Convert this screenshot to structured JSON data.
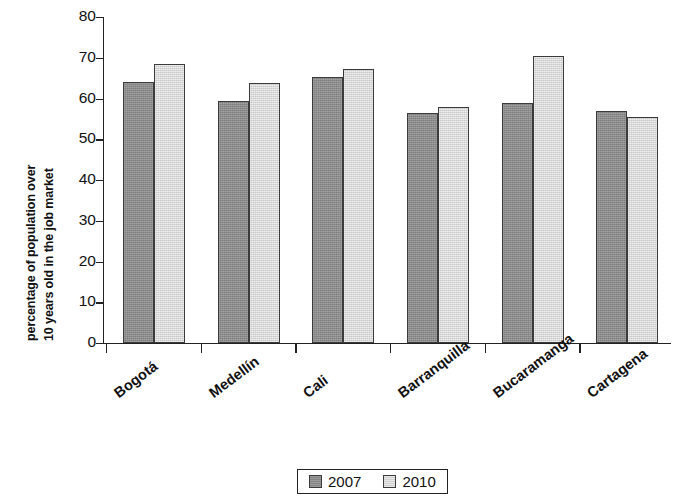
{
  "chart_data": {
    "type": "bar",
    "title": "",
    "xlabel": "",
    "ylabel": "percentage of population over 10 years old in the job market",
    "ylabel_lines": [
      "percentage of population over",
      "10 years old in the job market"
    ],
    "categories": [
      "Bogotá",
      "Medellín",
      "Cali",
      "Barranquilla",
      "Bucaramanga",
      "Cartagena"
    ],
    "series": [
      {
        "name": "2007",
        "color": "#8e8e8e",
        "values": [
          64.0,
          59.5,
          65.3,
          56.5,
          59.0,
          57.0
        ]
      },
      {
        "name": "2010",
        "color": "#dcdcdc",
        "values": [
          68.5,
          63.8,
          67.2,
          57.8,
          70.5,
          55.5
        ]
      }
    ],
    "ylim": [
      0,
      80
    ],
    "ytick_labels": [
      "0",
      "10",
      "20",
      "30",
      "40",
      "50",
      "60",
      "70",
      "80"
    ],
    "ytick_values": [
      0,
      10,
      20,
      30,
      40,
      50,
      60,
      70,
      80
    ],
    "grid": false,
    "legend_position": "bottom-center",
    "legend_entries": [
      "2007",
      "2010"
    ]
  },
  "legend": {
    "entry_2007": "2007",
    "entry_2010": "2010"
  }
}
